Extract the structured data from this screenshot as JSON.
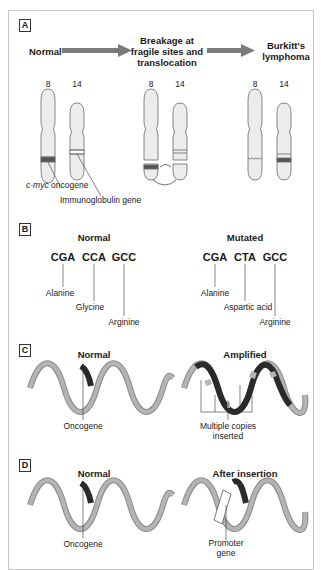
{
  "panels": {
    "a": {
      "label": "A",
      "stage_normal": "Normal",
      "stage_breakage_l1": "Breakage at",
      "stage_breakage_l2": "fragile sites and",
      "stage_breakage_l3": "translocation",
      "stage_burkitt_l1": "Burkitt's",
      "stage_burkitt_l2": "lymphoma",
      "chrom_8": "8",
      "chrom_14": "14",
      "label_cmyc_italic": "c-myc",
      "label_cmyc_rest": " oncogene",
      "label_ig": "Immunoglobulin gene"
    },
    "b": {
      "label": "B",
      "normal_title": "Normal",
      "mutated_title": "Mutated",
      "normal_codons": [
        "CGA",
        "CCA",
        "GCC"
      ],
      "normal_amino": [
        "Alanine",
        "Glycine",
        "Arginine"
      ],
      "mutated_codons": [
        "CGA",
        "CTA",
        "GCC"
      ],
      "mutated_amino": [
        "Alanine",
        "Aspartic acid",
        "Arginine"
      ]
    },
    "c": {
      "label": "C",
      "normal_title": "Normal",
      "amplified_title": "Amplified",
      "oncogene_label": "Oncogene",
      "multiple_l1": "Multiple copies",
      "multiple_l2": "inserted"
    },
    "d": {
      "label": "D",
      "normal_title": "Normal",
      "after_title": "After insertion",
      "oncogene_label": "Oncogene",
      "promoter_l1": "Promoter",
      "promoter_l2": "gene"
    }
  },
  "colors": {
    "dna_light": "#a8a8a8",
    "dna_dark": "#2a2a2a",
    "arrow": "#7a7a7a",
    "chromosome_fill": "#ececec",
    "chromosome_stroke": "#6a6a6a"
  }
}
